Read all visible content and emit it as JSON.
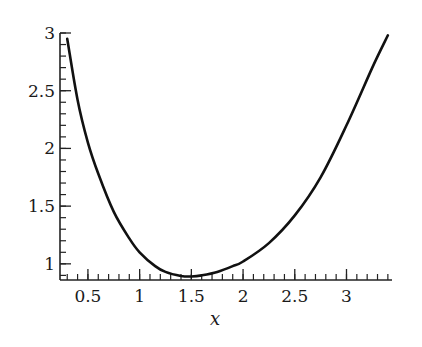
{
  "chart_data": {
    "type": "line",
    "title": "",
    "xlabel": "x",
    "ylabel": "",
    "xlim": [
      0.23,
      3.44
    ],
    "ylim": [
      0.86,
      3.0
    ],
    "grid": false,
    "legend": null,
    "x_ticks": [
      "0.5",
      "1",
      "1.5",
      "2",
      "2.5",
      "3"
    ],
    "x_tick_values": [
      0.5,
      1,
      1.5,
      2,
      2.5,
      3
    ],
    "y_ticks": [
      "1",
      "1.5",
      "2",
      "2.5",
      "3"
    ],
    "y_tick_values": [
      1,
      1.5,
      2,
      2.5,
      3
    ],
    "x_minor_step": 0.1,
    "y_minor_step": 0.1,
    "series": [
      {
        "name": "curve",
        "color": "#111111",
        "x": [
          0.3,
          0.4,
          0.5,
          0.6,
          0.75,
          0.9,
          1.0,
          1.15,
          1.25,
          1.4,
          1.5,
          1.6,
          1.75,
          1.9,
          2.0,
          2.25,
          2.5,
          2.75,
          3.0,
          3.25,
          3.4
        ],
        "values": [
          2.95,
          2.42,
          2.05,
          1.78,
          1.45,
          1.22,
          1.1,
          0.98,
          0.93,
          0.895,
          0.89,
          0.9,
          0.93,
          0.98,
          1.02,
          1.18,
          1.42,
          1.75,
          2.2,
          2.7,
          2.98
        ]
      }
    ]
  }
}
